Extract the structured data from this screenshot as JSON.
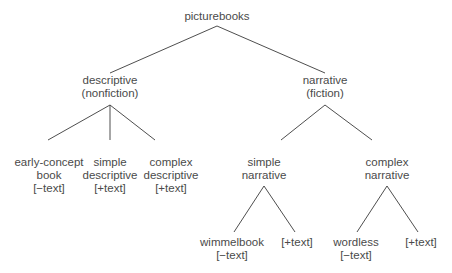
{
  "tree": {
    "root": {
      "label": "picturebooks"
    },
    "descriptive": {
      "line1": "descriptive",
      "line2": "(nonfiction)",
      "children": [
        {
          "line1": "early-concept",
          "line2": "book",
          "line3": "[−text]"
        },
        {
          "line1": "simple",
          "line2": "descriptive",
          "line3": "[+text]"
        },
        {
          "line1": "complex",
          "line2": "descriptive",
          "line3": "[+text]"
        }
      ]
    },
    "narrative": {
      "line1": "narrative",
      "line2": "(fiction)",
      "children": [
        {
          "line1": "simple",
          "line2": "narrative",
          "children": [
            {
              "line1": "wimmelbook",
              "line2": "[−text]"
            },
            {
              "line1": "[+text]"
            }
          ]
        },
        {
          "line1": "complex",
          "line2": "narrative",
          "children": [
            {
              "line1": "wordless",
              "line2": "[−text]"
            },
            {
              "line1": "[+text]"
            }
          ]
        }
      ]
    }
  },
  "colors": {
    "line": "#3a3a3a",
    "text": "#4a4a4a",
    "background": "#ffffff"
  }
}
